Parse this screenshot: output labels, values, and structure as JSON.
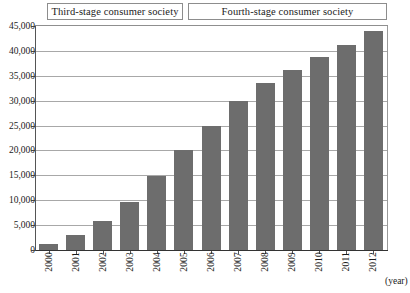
{
  "chart_data": {
    "type": "bar",
    "title": "",
    "subtitle": "",
    "xlabel": "(year)",
    "ylabel": "",
    "categories": [
      "2000",
      "2001",
      "2002",
      "2003",
      "2004",
      "2005",
      "2006",
      "2007",
      "2008",
      "2009",
      "2010",
      "2011",
      "2012"
    ],
    "values": [
      1200,
      3000,
      5900,
      9600,
      14800,
      20100,
      24900,
      30000,
      33500,
      36200,
      38800,
      41100,
      44000
    ],
    "ylim": [
      0,
      45000
    ],
    "ytick_labels": [
      "45,000",
      "40,000",
      "35,000",
      "30,000",
      "25,000",
      "20,000",
      "15,000",
      "10,000",
      "5,000",
      "0"
    ],
    "ytick_values": [
      45000,
      40000,
      35000,
      30000,
      25000,
      20000,
      15000,
      10000,
      5000,
      0
    ],
    "grid": true,
    "legend": "none",
    "bar_color": "#6d6d6d",
    "grid_color": "#a8a8a8",
    "axis_color": "#333333",
    "annotations": [
      {
        "label": "Third-stage consumer society",
        "from": "2000",
        "to": "2004"
      },
      {
        "label": "Fourth-stage consumer society",
        "from": "2005",
        "to": "2012"
      }
    ]
  },
  "stages": {
    "items": [
      {
        "label": "Third-stage consumer society"
      },
      {
        "label": "Fourth-stage consumer society"
      }
    ]
  },
  "axis": {
    "unit_label": "(year)"
  }
}
